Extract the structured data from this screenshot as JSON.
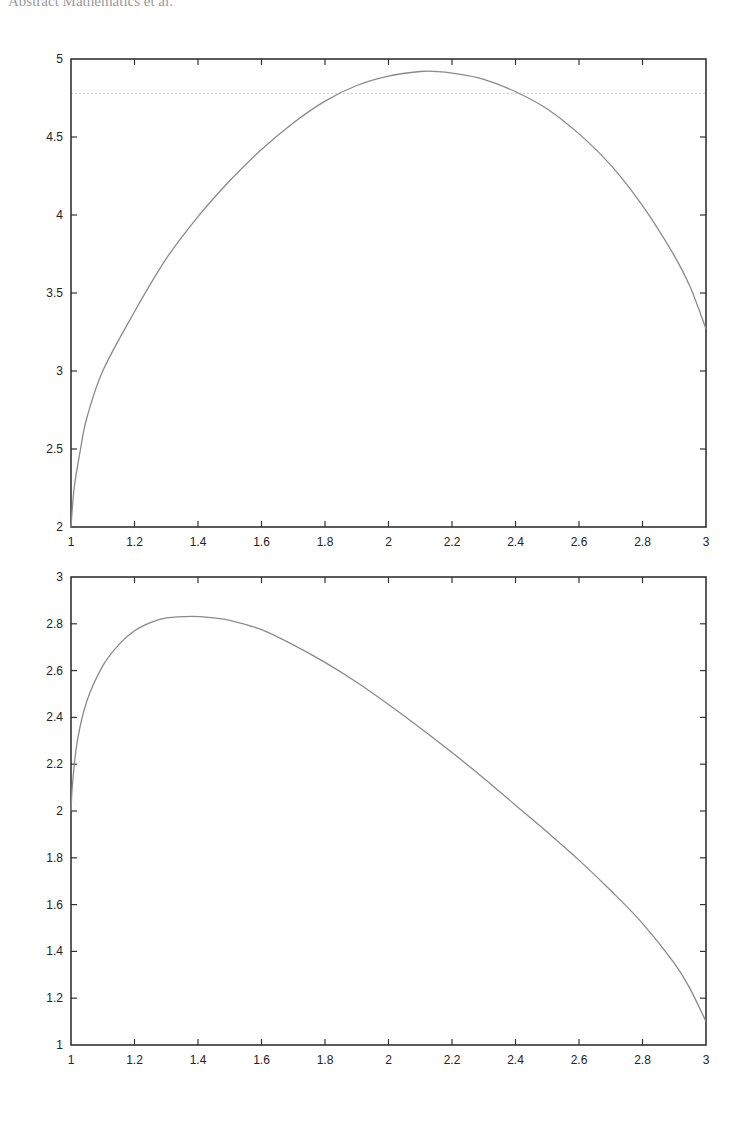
{
  "header": {
    "text": "Abstract Mathematics et al."
  },
  "chart_data": [
    {
      "type": "line",
      "title": "",
      "xlabel": "",
      "ylabel": "",
      "xlim": [
        1,
        3
      ],
      "ylim": [
        2,
        5
      ],
      "grid": false,
      "xticks": [
        "1",
        "1.2",
        "1.4",
        "1.6",
        "1.8",
        "2",
        "2.2",
        "2.4",
        "2.6",
        "2.8",
        "3"
      ],
      "yticks": [
        "2",
        "2.5",
        "3",
        "3.5",
        "4",
        "4.5",
        "5"
      ],
      "reference_line": {
        "style": "dotted",
        "y": 4.78
      },
      "series": [
        {
          "name": "curve",
          "x": [
            1.0,
            1.01,
            1.03,
            1.05,
            1.1,
            1.2,
            1.3,
            1.4,
            1.5,
            1.6,
            1.7,
            1.8,
            1.9,
            2.0,
            2.1,
            2.15,
            2.2,
            2.3,
            2.4,
            2.5,
            2.6,
            2.7,
            2.8,
            2.9,
            2.95,
            3.0
          ],
          "y": [
            2.0,
            2.25,
            2.5,
            2.7,
            3.0,
            3.38,
            3.72,
            3.99,
            4.22,
            4.42,
            4.59,
            4.73,
            4.83,
            4.89,
            4.92,
            4.92,
            4.91,
            4.87,
            4.79,
            4.68,
            4.52,
            4.32,
            4.06,
            3.74,
            3.54,
            3.27
          ]
        }
      ]
    },
    {
      "type": "line",
      "title": "",
      "xlabel": "",
      "ylabel": "",
      "xlim": [
        1,
        3
      ],
      "ylim": [
        1,
        3
      ],
      "grid": false,
      "xticks": [
        "1",
        "1.2",
        "1.4",
        "1.6",
        "1.8",
        "2",
        "2.2",
        "2.4",
        "2.6",
        "2.8",
        "3"
      ],
      "yticks": [
        "1",
        "1.2",
        "1.4",
        "1.6",
        "1.8",
        "2",
        "2.2",
        "2.4",
        "2.6",
        "2.8",
        "3"
      ],
      "series": [
        {
          "name": "curve",
          "x": [
            1.0,
            1.005,
            1.02,
            1.05,
            1.1,
            1.15,
            1.2,
            1.25,
            1.3,
            1.38,
            1.45,
            1.5,
            1.6,
            1.7,
            1.8,
            1.9,
            2.0,
            2.1,
            2.2,
            2.3,
            2.4,
            2.5,
            2.6,
            2.7,
            2.8,
            2.9,
            2.95,
            3.0
          ],
          "y": [
            2.0,
            2.12,
            2.3,
            2.47,
            2.62,
            2.71,
            2.77,
            2.805,
            2.825,
            2.832,
            2.825,
            2.815,
            2.775,
            2.71,
            2.635,
            2.55,
            2.455,
            2.355,
            2.25,
            2.14,
            2.025,
            1.91,
            1.79,
            1.66,
            1.52,
            1.35,
            1.24,
            1.1
          ]
        }
      ]
    }
  ]
}
